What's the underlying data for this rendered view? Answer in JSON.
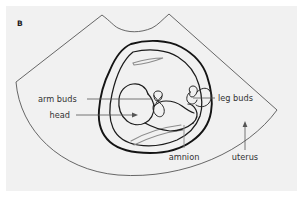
{
  "figure": {
    "panel_letter": "B",
    "background_color": "#f1f1f1",
    "page_color": "#ffffff",
    "line_color": "#1b1b1b",
    "sector_color": "#4d4d4d",
    "echo_color": "#8c8c8c",
    "leader_color": "#555555"
  },
  "annotations": {
    "arm_buds": {
      "label": "arm buds",
      "position": "left",
      "has_arrowhead": false
    },
    "head": {
      "label": "head",
      "position": "left",
      "has_arrowhead": true
    },
    "leg_buds": {
      "label": "leg buds",
      "position": "right",
      "has_arrowhead": false
    },
    "amnion": {
      "label": "amnion",
      "position": "bottom-center",
      "has_arrowhead": false
    },
    "uterus": {
      "label": "uterus",
      "position": "bottom-right",
      "has_arrowhead": true
    }
  },
  "structures": {
    "sector_scan": "ultrasound-sector-field",
    "uterus_wall": "uterus-outline",
    "amnion_sac": "amniotic-sac-outline",
    "embryo": "embryo-outline",
    "embryo_head": "embryo-head",
    "arm_bud_shapes": "arm-bud-pair",
    "leg_bud_shapes": "leg-bud-pair"
  }
}
